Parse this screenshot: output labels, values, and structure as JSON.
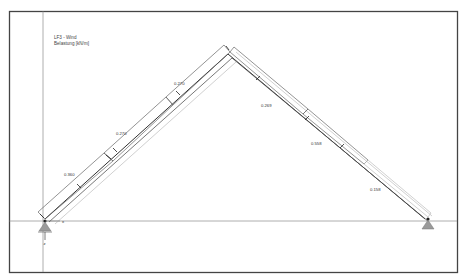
{
  "legend": {
    "line1": "LF3 - Wind",
    "line2": "Belastung [kN/m]"
  },
  "structure": {
    "type": "gable-frame",
    "left_support": {
      "x": 45,
      "y": 221,
      "label_z": "z",
      "label_x": "x"
    },
    "apex": {
      "x": 228,
      "y": 52
    },
    "right_support": {
      "x": 425,
      "y": 221
    }
  },
  "loads": {
    "left_rafter": [
      {
        "value": "0.360",
        "label_x": 72,
        "label_y": 178
      },
      {
        "value": "0.270",
        "label_x": 118,
        "label_y": 133
      },
      {
        "value": "0.270",
        "label_x": 178,
        "label_y": 83
      }
    ],
    "right_rafter": [
      {
        "value": "0.269",
        "label_x": 262,
        "label_y": 106
      },
      {
        "value": "0.558",
        "label_x": 312,
        "label_y": 143
      },
      {
        "value": "0.158",
        "label_x": 371,
        "label_y": 190
      }
    ]
  },
  "colors": {
    "frame": "#444444",
    "member": "#333333",
    "axis": "#9a9a9a",
    "support": "#9a9a9a"
  }
}
